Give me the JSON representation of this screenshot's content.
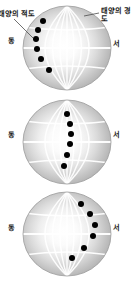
{
  "figure": {
    "annotations": {
      "solar_equator": "태양의 적도",
      "solar_longitude": "태양의 경도"
    },
    "direction_labels": {
      "east": "동",
      "west": "서"
    },
    "colors": {
      "sphere_edge": "#a8a8a8",
      "sphere_center": "#ffffff",
      "grid_line": "#ffffff",
      "spot": "#000000",
      "leader_line": "#4d4d4d",
      "text": "#1a1a1a",
      "background": "#ffffff"
    },
    "globes": [
      {
        "index": 1,
        "cx": 67,
        "cy": 48,
        "rx": 44,
        "ry": 42,
        "east_label": "동",
        "west_label": "서",
        "spots": [
          {
            "x": 43,
            "y": 21,
            "r": 3.0
          },
          {
            "x": 38,
            "y": 30,
            "r": 3.0
          },
          {
            "x": 36,
            "y": 39,
            "r": 3.0
          },
          {
            "x": 37,
            "y": 49,
            "r": 3.0
          },
          {
            "x": 41,
            "y": 59,
            "r": 3.0
          },
          {
            "x": 49,
            "y": 70,
            "r": 3.0
          }
        ]
      },
      {
        "index": 2,
        "cx": 67,
        "cy": 142,
        "rx": 44,
        "ry": 42,
        "east_label": "동",
        "west_label": "서",
        "spots": [
          {
            "x": 67,
            "y": 114,
            "r": 3.0
          },
          {
            "x": 70,
            "y": 124,
            "r": 3.0
          },
          {
            "x": 71,
            "y": 134,
            "r": 3.0
          },
          {
            "x": 70,
            "y": 144,
            "r": 3.0
          },
          {
            "x": 67,
            "y": 155,
            "r": 3.0
          },
          {
            "x": 64,
            "y": 166,
            "r": 3.0
          }
        ]
      },
      {
        "index": 3,
        "cx": 67,
        "cy": 234,
        "rx": 44,
        "ry": 42,
        "east_label": "동",
        "west_label": "서",
        "spots": [
          {
            "x": 81,
            "y": 204,
            "r": 3.0
          },
          {
            "x": 90,
            "y": 214,
            "r": 3.0
          },
          {
            "x": 95,
            "y": 225,
            "r": 3.0
          },
          {
            "x": 93,
            "y": 236,
            "r": 3.0
          },
          {
            "x": 84,
            "y": 248,
            "r": 3.0
          },
          {
            "x": 72,
            "y": 258,
            "r": 3.0
          }
        ]
      }
    ],
    "leaders": [
      {
        "name": "equator-leader",
        "x1": 14,
        "y1": 19,
        "x2": 33,
        "y2": 38
      },
      {
        "name": "longitude-leader",
        "x1": 99,
        "y1": 13,
        "x2": 84,
        "y2": 16
      }
    ]
  }
}
